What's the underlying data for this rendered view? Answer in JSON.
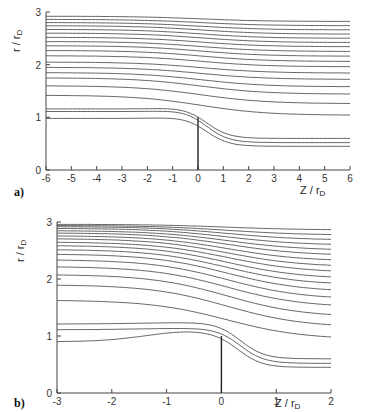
{
  "chart_data": [
    {
      "panel": "a)",
      "type": "line",
      "title": "",
      "xlabel": "Z / r_D",
      "ylabel": "r / r_D",
      "xlim": [
        -6,
        6
      ],
      "ylim": [
        0,
        3
      ],
      "xticks": [
        "-6",
        "-5",
        "-4",
        "-3",
        "-2",
        "-1",
        "0",
        "1",
        "2",
        "3",
        "4",
        "5",
        "6"
      ],
      "yticks": [
        "0",
        "1",
        "2",
        "3"
      ],
      "grid": false,
      "electrode": {
        "z": 0,
        "r_top": 1.0
      },
      "series_description": "Streamlines (field lines) starting at left; lines below r≈1.2 dip around electrode tip at z=0",
      "series": [
        {
          "name": "line1",
          "r_left": 0.98,
          "r_right": 0.45
        },
        {
          "name": "line2",
          "r_left": 1.11,
          "r_right": 0.52
        },
        {
          "name": "line3",
          "r_left": 1.16,
          "r_right": 0.6
        },
        {
          "name": "line4",
          "r_left": 1.42,
          "r_right": 1.04
        },
        {
          "name": "line5",
          "r_left": 1.6,
          "r_right": 1.26
        },
        {
          "name": "line6",
          "r_left": 1.75,
          "r_right": 1.44
        },
        {
          "name": "line7",
          "r_left": 1.85,
          "r_right": 1.58
        },
        {
          "name": "line8",
          "r_left": 1.95,
          "r_right": 1.72
        },
        {
          "name": "line9",
          "r_left": 2.05,
          "r_right": 1.84
        },
        {
          "name": "line10",
          "r_left": 2.17,
          "r_right": 1.96
        },
        {
          "name": "line11",
          "r_left": 2.27,
          "r_right": 2.06
        },
        {
          "name": "line12",
          "r_left": 2.36,
          "r_right": 2.16
        },
        {
          "name": "line13",
          "r_left": 2.44,
          "r_right": 2.25
        },
        {
          "name": "line14",
          "r_left": 2.52,
          "r_right": 2.34
        },
        {
          "name": "line15",
          "r_left": 2.6,
          "r_right": 2.42
        },
        {
          "name": "line16",
          "r_left": 2.67,
          "r_right": 2.5
        },
        {
          "name": "line17",
          "r_left": 2.74,
          "r_right": 2.58
        },
        {
          "name": "line18",
          "r_left": 2.8,
          "r_right": 2.66
        },
        {
          "name": "line19",
          "r_left": 2.86,
          "r_right": 2.74
        },
        {
          "name": "line20",
          "r_left": 2.92,
          "r_right": 2.82
        }
      ]
    },
    {
      "panel": "b)",
      "type": "line",
      "title": "",
      "xlabel": "Z / r_D",
      "ylabel": "r / r_D",
      "xlim": [
        -3,
        2
      ],
      "ylim": [
        0,
        3
      ],
      "xticks": [
        "-3",
        "-2",
        "-1",
        "0",
        "1",
        "2"
      ],
      "yticks": [
        "0",
        "1",
        "2",
        "3"
      ],
      "grid": false,
      "electrode": {
        "z": 0,
        "r_top": 1.0
      },
      "series_description": "Same streamline family, expanded view near electrode tip",
      "series": [
        {
          "name": "line1",
          "r_left": 0.9,
          "r_right": 0.45
        },
        {
          "name": "line2",
          "r_left": 1.11,
          "r_right": 0.52
        },
        {
          "name": "line3",
          "r_left": 1.21,
          "r_right": 0.6
        },
        {
          "name": "line4",
          "r_left": 1.63,
          "r_right": 0.94
        },
        {
          "name": "line5",
          "r_left": 1.9,
          "r_right": 1.15
        },
        {
          "name": "line6",
          "r_left": 2.08,
          "r_right": 1.33
        },
        {
          "name": "line7",
          "r_left": 2.22,
          "r_right": 1.5
        },
        {
          "name": "line8",
          "r_left": 2.34,
          "r_right": 1.64
        },
        {
          "name": "line9",
          "r_left": 2.44,
          "r_right": 1.77
        },
        {
          "name": "line10",
          "r_left": 2.52,
          "r_right": 1.89
        },
        {
          "name": "line11",
          "r_left": 2.59,
          "r_right": 2.0
        },
        {
          "name": "line12",
          "r_left": 2.65,
          "r_right": 2.11
        },
        {
          "name": "line13",
          "r_left": 2.71,
          "r_right": 2.21
        },
        {
          "name": "line14",
          "r_left": 2.76,
          "r_right": 2.31
        },
        {
          "name": "line15",
          "r_left": 2.81,
          "r_right": 2.41
        },
        {
          "name": "line16",
          "r_left": 2.85,
          "r_right": 2.5
        },
        {
          "name": "line17",
          "r_left": 2.89,
          "r_right": 2.59
        },
        {
          "name": "line18",
          "r_left": 2.92,
          "r_right": 2.68
        },
        {
          "name": "line19",
          "r_left": 2.94,
          "r_right": 2.77
        },
        {
          "name": "line20",
          "r_left": 2.96,
          "r_right": 2.86
        }
      ]
    }
  ],
  "labels": {
    "panel_a": "a)",
    "panel_b": "b)",
    "xlabel": "Z / r",
    "xlabel_sub": "D",
    "ylabel": "r / r",
    "ylabel_sub": "D"
  }
}
